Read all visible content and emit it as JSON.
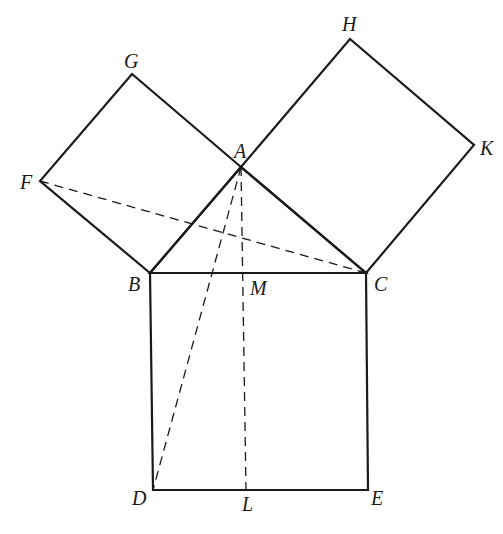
{
  "diagram": {
    "points": {
      "A": {
        "x": 241,
        "y": 167,
        "label": "A"
      },
      "B": {
        "x": 150,
        "y": 273,
        "label": "B"
      },
      "C": {
        "x": 366,
        "y": 273,
        "label": "C"
      },
      "D": {
        "x": 153,
        "y": 490,
        "label": "D"
      },
      "E": {
        "x": 368,
        "y": 490,
        "label": "E"
      },
      "F": {
        "x": 40,
        "y": 181,
        "label": "F"
      },
      "G": {
        "x": 132,
        "y": 74,
        "label": "G"
      },
      "H": {
        "x": 350,
        "y": 39,
        "label": "H"
      },
      "K": {
        "x": 474,
        "y": 145,
        "label": "K"
      },
      "M": {
        "x": 244,
        "y": 273,
        "label": "M"
      },
      "L": {
        "x": 246,
        "y": 490,
        "label": "L"
      }
    },
    "labels": {
      "A": "A",
      "B": "B",
      "C": "C",
      "D": "D",
      "E": "E",
      "F": "F",
      "G": "G",
      "H": "H",
      "K": "K",
      "M": "M",
      "L": "L"
    },
    "solid_segments": [
      [
        "A",
        "B"
      ],
      [
        "A",
        "C"
      ],
      [
        "B",
        "C"
      ],
      [
        "B",
        "F"
      ],
      [
        "F",
        "G"
      ],
      [
        "G",
        "A"
      ],
      [
        "A",
        "H"
      ],
      [
        "H",
        "K"
      ],
      [
        "K",
        "C"
      ],
      [
        "B",
        "D"
      ],
      [
        "D",
        "E"
      ],
      [
        "E",
        "C"
      ]
    ],
    "dashed_segments": [
      [
        "F",
        "C"
      ],
      [
        "A",
        "D"
      ],
      [
        "A",
        "L"
      ]
    ],
    "colors": {
      "stroke": "#1a1a1a",
      "background": "#ffffff"
    }
  }
}
